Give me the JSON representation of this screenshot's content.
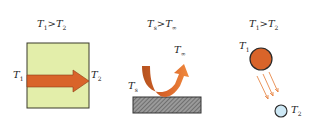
{
  "panels": [
    {
      "name": "conduction",
      "condition": {
        "a": "T",
        "a_sub": "1",
        "op": ">",
        "b": "T",
        "b_sub": "2"
      },
      "left_label": {
        "t": "T",
        "sub": "1"
      },
      "right_label": {
        "t": "T",
        "sub": "2"
      }
    },
    {
      "name": "convection",
      "condition": {
        "a": "T",
        "a_sub": "s",
        "op": ">",
        "b": "T",
        "b_sub": "∞"
      },
      "surface_label": {
        "t": "T",
        "sub": "s"
      },
      "fluid_label": {
        "t": "T",
        "sub": "∞"
      }
    },
    {
      "name": "radiation",
      "condition": {
        "a": "T",
        "a_sub": "1",
        "op": ">",
        "b": "T",
        "b_sub": "2"
      },
      "hot_label": {
        "t": "T",
        "sub": "1"
      },
      "cold_label": {
        "t": "T",
        "sub": "2"
      }
    }
  ],
  "colors": {
    "slab_fill": "#e3eeaa",
    "arrow": "#d9642a",
    "surface": "#888888",
    "hot_body": "#d9642a",
    "cold_body": "#cde8f5",
    "outline": "#333333"
  }
}
